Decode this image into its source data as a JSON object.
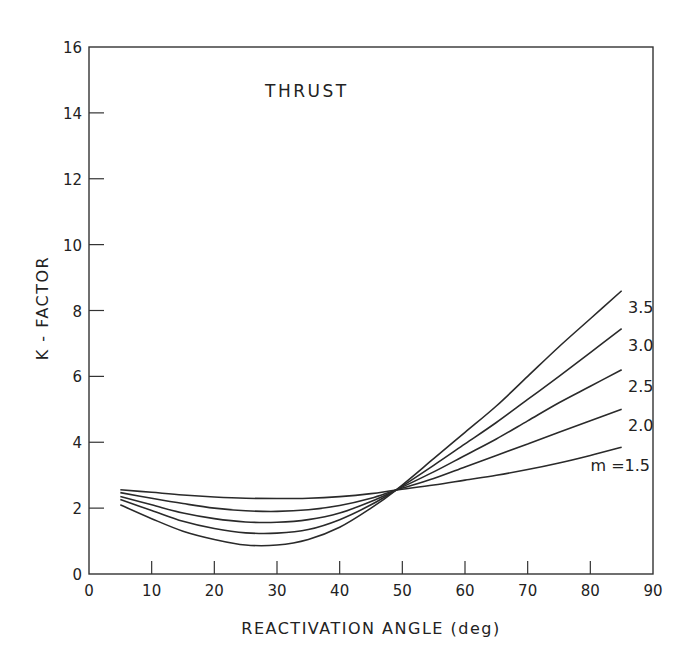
{
  "chart_data": {
    "type": "line",
    "title": "THRUST",
    "xlabel": "REACTIVATION ANGLE (deg)",
    "ylabel": "K - FACTOR",
    "xlim": [
      0,
      90
    ],
    "ylim": [
      0,
      16
    ],
    "xticks": [
      0,
      10,
      20,
      30,
      40,
      50,
      60,
      70,
      80,
      90
    ],
    "yticks": [
      0,
      2,
      4,
      6,
      8,
      10,
      12,
      14,
      16
    ],
    "grid": false,
    "legend": "inline labels at right end of each curve",
    "x": [
      5,
      10,
      15,
      20,
      25,
      30,
      35,
      40,
      45,
      49,
      55,
      60,
      65,
      70,
      75,
      80,
      85
    ],
    "series": [
      {
        "name": "m = 1.5",
        "label": "m =1.5",
        "values": [
          2.56,
          2.48,
          2.4,
          2.34,
          2.3,
          2.29,
          2.3,
          2.35,
          2.44,
          2.55,
          2.7,
          2.85,
          3.0,
          3.17,
          3.37,
          3.6,
          3.85
        ]
      },
      {
        "name": "m = 2.0",
        "label": "2.0",
        "values": [
          2.47,
          2.3,
          2.14,
          2.0,
          1.92,
          1.9,
          1.95,
          2.08,
          2.3,
          2.55,
          2.9,
          3.25,
          3.6,
          3.95,
          4.3,
          4.65,
          5.0
        ]
      },
      {
        "name": "m = 2.5",
        "label": "2.5",
        "values": [
          2.35,
          2.1,
          1.85,
          1.68,
          1.58,
          1.57,
          1.65,
          1.85,
          2.2,
          2.55,
          3.1,
          3.6,
          4.1,
          4.65,
          5.2,
          5.7,
          6.2
        ]
      },
      {
        "name": "m = 3.0",
        "label": "3.0",
        "values": [
          2.26,
          1.93,
          1.6,
          1.38,
          1.25,
          1.24,
          1.35,
          1.65,
          2.1,
          2.55,
          3.3,
          3.95,
          4.6,
          5.3,
          6.0,
          6.72,
          7.45
        ]
      },
      {
        "name": "m = 3.5",
        "label": "3.5",
        "values": [
          2.1,
          1.68,
          1.3,
          1.05,
          0.88,
          0.88,
          1.05,
          1.42,
          2.0,
          2.55,
          3.5,
          4.3,
          5.1,
          6.0,
          6.9,
          7.75,
          8.6
        ]
      }
    ]
  },
  "labels": {
    "title": "THRUST",
    "xlabel": "REACTIVATION ANGLE (deg)",
    "ylabel": "K - FACTOR"
  }
}
